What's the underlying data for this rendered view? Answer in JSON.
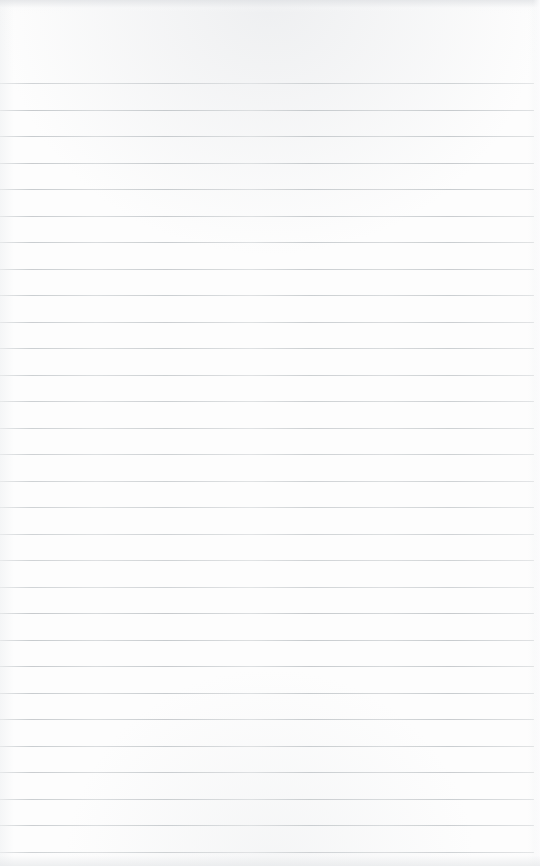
{
  "document": {
    "kind": "scanned-notebook-page",
    "title": "Blank Ruled Notebook Page",
    "page_width": 540,
    "page_height": 866,
    "paper_color": "#fdfdfd",
    "rule_color": "#c6cacd",
    "has_written_content": false,
    "has_margin_rule": false,
    "content_text": ""
  },
  "ruling": {
    "line_count": 30,
    "first_line_y": 83,
    "spacing": 26.5,
    "line_thickness": 1,
    "left_inset": 0,
    "right_inset": 6,
    "lines_y": [
      83,
      109.5,
      136,
      162.5,
      189,
      215.5,
      242,
      268.5,
      295,
      321.5,
      348,
      374.5,
      401,
      427.5,
      454,
      480.5,
      507,
      533.5,
      560,
      586.5,
      613,
      639.5,
      666,
      692.5,
      719,
      745.5,
      772,
      798.5,
      825,
      851.5
    ]
  },
  "artifacts": {
    "top_shadow_height": 13,
    "bottom_shadow_height": 15,
    "edge_vignette_color": "#e6e8ea"
  }
}
